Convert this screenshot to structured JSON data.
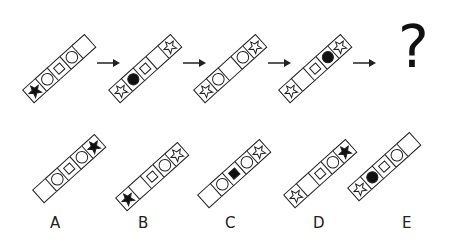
{
  "puzzle": {
    "sequence": [
      {
        "cells": [
          "star-black",
          "circle",
          "square",
          "circle",
          "empty"
        ]
      },
      {
        "cells": [
          "star-white",
          "circle-black",
          "square",
          "empty",
          "star-white"
        ]
      },
      {
        "cells": [
          "star-white",
          "circle",
          "empty",
          "circle",
          "star-white"
        ]
      },
      {
        "cells": [
          "star-white",
          "empty",
          "square",
          "circle-black",
          "star-white"
        ]
      }
    ],
    "question_mark": "?",
    "options": [
      {
        "label": "A",
        "cells": [
          "empty",
          "circle",
          "square",
          "circle",
          "star-black"
        ]
      },
      {
        "label": "B",
        "cells": [
          "star-black",
          "empty",
          "square",
          "circle",
          "star-white"
        ]
      },
      {
        "label": "C",
        "cells": [
          "empty",
          "circle",
          "square-black",
          "circle",
          "star-white"
        ]
      },
      {
        "label": "D",
        "cells": [
          "star-white",
          "empty",
          "square",
          "circle",
          "star-black"
        ]
      },
      {
        "label": "E",
        "cells": [
          "star-white",
          "circle-black",
          "square",
          "circle",
          "empty"
        ]
      }
    ]
  }
}
